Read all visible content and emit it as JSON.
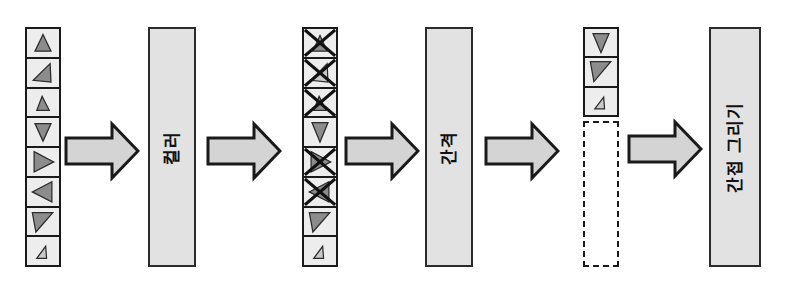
{
  "diagram": {
    "orientation": "left-to-right, labels rotated 90 degrees counter-clockwise",
    "colors": {
      "stroke": "#1a1a1a",
      "cell_fill": "#ededed",
      "box_fill": "#e2e2e2",
      "arrow_fill": "#d4d4d4",
      "triangle_fill_dark": "#8c8c8c",
      "triangle_fill_light": "#c9c9c9",
      "page_background": "#ffffff"
    },
    "stages": [
      {
        "id": "input-list",
        "kind": "cell-stack",
        "cell_count": 8,
        "items": [
          {
            "index": 0,
            "shape": "triangle-up",
            "fill": "dark",
            "struck": false
          },
          {
            "index": 1,
            "shape": "triangle-left-down",
            "fill": "dark",
            "struck": false
          },
          {
            "index": 2,
            "shape": "triangle-up-small",
            "fill": "dark",
            "struck": false
          },
          {
            "index": 3,
            "shape": "triangle-down",
            "fill": "dark",
            "struck": false
          },
          {
            "index": 4,
            "shape": "triangle-right",
            "fill": "dark",
            "struck": false
          },
          {
            "index": 5,
            "shape": "triangle-left",
            "fill": "dark",
            "struck": false
          },
          {
            "index": 6,
            "shape": "triangle-down-right",
            "fill": "dark",
            "struck": false
          },
          {
            "index": 7,
            "shape": "triangle-tiny",
            "fill": "light",
            "struck": false
          }
        ]
      },
      {
        "id": "process-color",
        "kind": "process-box",
        "label": "컬러"
      },
      {
        "id": "culled-list",
        "kind": "cell-stack",
        "cell_count": 8,
        "items": [
          {
            "index": 0,
            "shape": "triangle-up",
            "fill": "dark",
            "struck": true
          },
          {
            "index": 1,
            "shape": "triangle-left-down",
            "fill": "light",
            "struck": true
          },
          {
            "index": 2,
            "shape": "triangle-up-small",
            "fill": "dark",
            "struck": true
          },
          {
            "index": 3,
            "shape": "triangle-down",
            "fill": "dark",
            "struck": false
          },
          {
            "index": 4,
            "shape": "triangle-right",
            "fill": "dark",
            "struck": true
          },
          {
            "index": 5,
            "shape": "triangle-left",
            "fill": "dark",
            "struck": true
          },
          {
            "index": 6,
            "shape": "triangle-down-right",
            "fill": "dark",
            "struck": false
          },
          {
            "index": 7,
            "shape": "triangle-tiny",
            "fill": "light",
            "struck": false
          }
        ]
      },
      {
        "id": "process-spacing",
        "kind": "process-box",
        "label": "간격"
      },
      {
        "id": "compacted-list",
        "kind": "cell-stack-with-placeholder",
        "cell_count": 3,
        "items": [
          {
            "index": 0,
            "shape": "triangle-down",
            "fill": "dark",
            "struck": false
          },
          {
            "index": 1,
            "shape": "triangle-down-right",
            "fill": "dark",
            "struck": false
          },
          {
            "index": 2,
            "shape": "triangle-tiny",
            "fill": "light",
            "struck": false
          }
        ],
        "placeholder": {
          "style": "dashed",
          "empty": true
        }
      },
      {
        "id": "process-indirect-draw",
        "kind": "process-box",
        "label": "간접 그리기"
      }
    ],
    "arrows": [
      {
        "id": "arrow-1",
        "from": "input-list",
        "to": "process-color"
      },
      {
        "id": "arrow-2",
        "from": "process-color",
        "to": "culled-list"
      },
      {
        "id": "arrow-3",
        "from": "culled-list",
        "to": "process-spacing"
      },
      {
        "id": "arrow-4",
        "from": "process-spacing",
        "to": "compacted-list"
      },
      {
        "id": "arrow-5",
        "from": "compacted-list",
        "to": "process-indirect-draw"
      }
    ]
  }
}
